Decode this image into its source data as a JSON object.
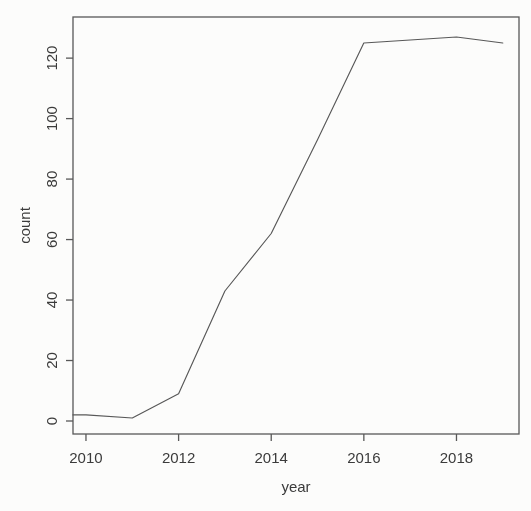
{
  "figure": {
    "background_color": "#fcfcfb",
    "ink_color": "#585858",
    "text_color": "#3b3b3b"
  },
  "chart_data": {
    "type": "line",
    "title": "",
    "xlabel": "year",
    "ylabel": "count",
    "x": [
      2009,
      2010,
      2011,
      2012,
      2013,
      2014,
      2015,
      2016,
      2017,
      2018,
      2019
    ],
    "series": [
      {
        "name": "count",
        "values": [
          2,
          2,
          1,
          9,
          43,
          62,
          93,
          125,
          126,
          127,
          125
        ]
      }
    ],
    "x_ticks": [
      2010,
      2012,
      2014,
      2016,
      2018
    ],
    "y_ticks": [
      0,
      20,
      40,
      60,
      80,
      100,
      120
    ],
    "xlim": [
      2009.72,
      2019.35
    ],
    "ylim": [
      -4.3,
      133.6
    ],
    "grid": false,
    "legend": "none"
  }
}
